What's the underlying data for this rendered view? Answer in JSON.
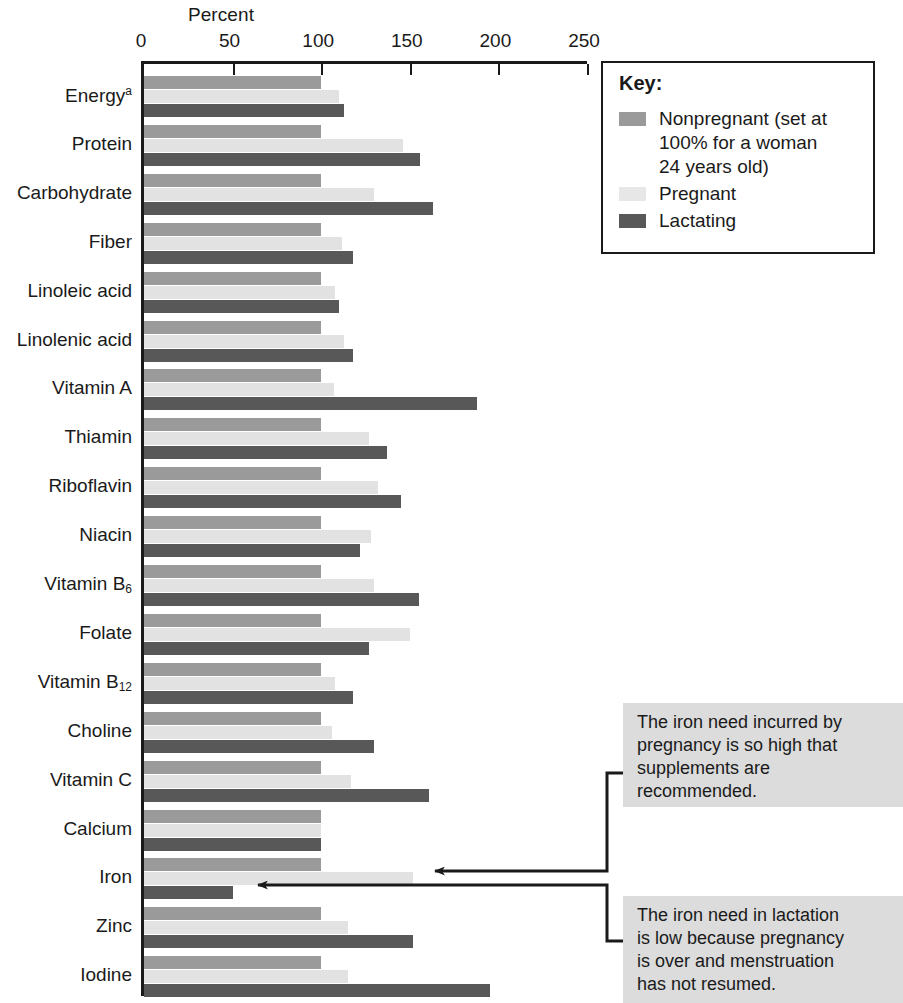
{
  "chart_data": {
    "type": "bar",
    "orientation": "horizontal",
    "title": "Percent",
    "xlabel": "Percent",
    "ylabel": "",
    "xlim": [
      0,
      250
    ],
    "xticks": [
      0,
      50,
      100,
      150,
      200,
      250
    ],
    "grid": false,
    "legend_position": "top-right",
    "categories": [
      "Energy",
      "Protein",
      "Carbohydrate",
      "Fiber",
      "Linoleic acid",
      "Linolenic acid",
      "Vitamin A",
      "Thiamin",
      "Riboflavin",
      "Niacin",
      "Vitamin B6",
      "Folate",
      "Vitamin B12",
      "Choline",
      "Vitamin C",
      "Calcium",
      "Iron",
      "Zinc",
      "Iodine"
    ],
    "series": [
      {
        "name": "Nonpregnant",
        "color": "#9a9a9a",
        "values": [
          100,
          100,
          100,
          100,
          100,
          100,
          100,
          100,
          100,
          100,
          100,
          100,
          100,
          100,
          100,
          100,
          100,
          100,
          100
        ]
      },
      {
        "name": "Pregnant",
        "color": "#e2e2e2",
        "values": [
          110,
          146,
          130,
          112,
          108,
          113,
          107,
          127,
          132,
          128,
          130,
          150,
          108,
          106,
          117,
          100,
          152,
          115,
          115
        ]
      },
      {
        "name": "Lactating",
        "color": "#585858",
        "values": [
          113,
          156,
          163,
          118,
          110,
          118,
          188,
          137,
          145,
          122,
          155,
          127,
          118,
          130,
          161,
          100,
          50,
          152,
          195
        ]
      }
    ],
    "annotations": [
      {
        "id": "pregnancy-iron-note",
        "text": "The iron need incurred by\npregnancy is so high that\nsupplements are\nrecommended.",
        "points_to": "Iron / Pregnant bar"
      },
      {
        "id": "lactation-iron-note",
        "text": "The iron need in lactation\nis low because pregnancy\nis over and menstruation\nhas not resumed.",
        "points_to": "Iron / Lactating bar"
      }
    ]
  },
  "axis": {
    "title": "Percent",
    "ticks": [
      "0",
      "50",
      "100",
      "150",
      "200",
      "250"
    ]
  },
  "category_labels": [
    {
      "text": "Energy",
      "sup": "a",
      "sub": ""
    },
    {
      "text": "Protein",
      "sup": "",
      "sub": ""
    },
    {
      "text": "Carbohydrate",
      "sup": "",
      "sub": ""
    },
    {
      "text": "Fiber",
      "sup": "",
      "sub": ""
    },
    {
      "text": "Linoleic acid",
      "sup": "",
      "sub": ""
    },
    {
      "text": "Linolenic acid",
      "sup": "",
      "sub": ""
    },
    {
      "text": "Vitamin A",
      "sup": "",
      "sub": ""
    },
    {
      "text": "Thiamin",
      "sup": "",
      "sub": ""
    },
    {
      "text": "Riboflavin",
      "sup": "",
      "sub": ""
    },
    {
      "text": "Niacin",
      "sup": "",
      "sub": ""
    },
    {
      "text": "Vitamin B",
      "sup": "",
      "sub": "6"
    },
    {
      "text": "Folate",
      "sup": "",
      "sub": ""
    },
    {
      "text": "Vitamin B",
      "sup": "",
      "sub": "12"
    },
    {
      "text": "Choline",
      "sup": "",
      "sub": ""
    },
    {
      "text": "Vitamin C",
      "sup": "",
      "sub": ""
    },
    {
      "text": "Calcium",
      "sup": "",
      "sub": ""
    },
    {
      "text": "Iron",
      "sup": "",
      "sub": ""
    },
    {
      "text": "Zinc",
      "sup": "",
      "sub": ""
    },
    {
      "text": "Iodine",
      "sup": "",
      "sub": ""
    }
  ],
  "legend": {
    "title": "Key:",
    "items": [
      {
        "swatch": "sw-nonpregnant",
        "label": "Nonpregnant (set at\n100% for a woman\n24 years old)"
      },
      {
        "swatch": "sw-pregnant",
        "label": "Pregnant"
      },
      {
        "swatch": "sw-lactating",
        "label": "Lactating"
      }
    ]
  },
  "callouts": {
    "pregnancy": "The iron need incurred by\npregnancy is so high that\nsupplements are\nrecommended.",
    "lactation": "The iron need in lactation\nis low because pregnancy\nis over and menstruation\nhas not resumed."
  },
  "colors": {
    "nonpregnant": "#9a9a9a",
    "pregnant": "#e2e2e2",
    "lactating": "#585858",
    "axis": "#1a1a1a",
    "callout_bg": "#dcdcdc"
  }
}
